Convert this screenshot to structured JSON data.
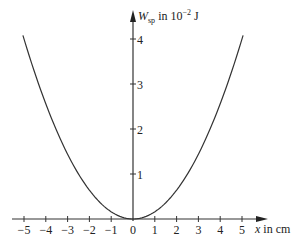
{
  "chart_data": {
    "type": "line",
    "title": "",
    "xlabel": "x in cm",
    "ylabel_main": "W",
    "ylabel_sub": "sp",
    "ylabel_rest": " in 10",
    "ylabel_exp": "−2",
    "ylabel_unit": " J",
    "xlim": [
      -5.1,
      5.1
    ],
    "ylim": [
      0,
      4.2
    ],
    "x_ticks": [
      -5,
      -4,
      -3,
      -2,
      -1,
      0,
      1,
      2,
      3,
      4,
      5
    ],
    "x_tick_labels": [
      "−5",
      "−4",
      "−3",
      "−2",
      "−1",
      "0",
      "1",
      "2",
      "3",
      "4",
      "5"
    ],
    "y_ticks": [
      1,
      2,
      3,
      4
    ],
    "y_tick_labels": [
      "1",
      "2",
      "3",
      "4"
    ],
    "grid": false,
    "legend": null,
    "series": [
      {
        "name": "W_sp = 0.16·x²",
        "x": [
          -5,
          -4,
          -3,
          -2,
          -1,
          0,
          1,
          2,
          3,
          4,
          5
        ],
        "values": [
          4.0,
          2.56,
          1.44,
          0.64,
          0.16,
          0.0,
          0.16,
          0.64,
          1.44,
          2.56,
          4.0
        ]
      }
    ]
  }
}
